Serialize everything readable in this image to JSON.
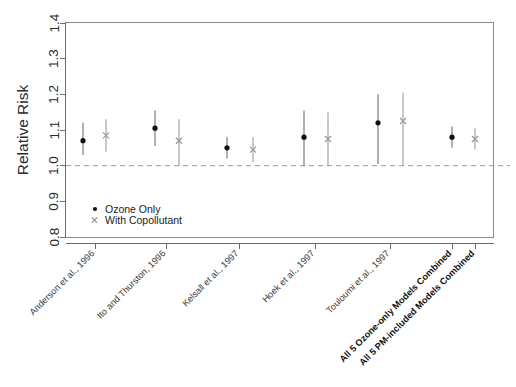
{
  "chart_data": {
    "type": "scatter",
    "title": "",
    "subtitle": "",
    "xlabel": "",
    "ylabel": "Relative Risk",
    "ylim": [
      0.8,
      1.4
    ],
    "yticks": [
      "0.8",
      "0.9",
      "1.0",
      "1.1",
      "1.2",
      "1.3",
      "1.4"
    ],
    "ytick_values": [
      0.8,
      0.9,
      1.0,
      1.1,
      1.2,
      1.3,
      1.4
    ],
    "grid": false,
    "reference_line": 1.0,
    "legend_position": "bottom-left",
    "categories": [
      "Anderson et al., 1996",
      "Ito and Thurston, 1996",
      "Kelsall et al., 1997",
      "Hoek et al., 1997",
      "Touloumi et al., 1997",
      "All 5 Ozone-only Models Combined",
      "All 5 PM-included Models Combined"
    ],
    "categories_bold": [
      false,
      false,
      false,
      false,
      false,
      true,
      true
    ],
    "series": [
      {
        "name": "Ozone Only",
        "marker": "dot",
        "points": [
          {
            "category": "Anderson et al., 1996",
            "value": 1.07,
            "low": 1.03,
            "high": 1.12
          },
          {
            "category": "Ito and Thurston, 1996",
            "value": 1.105,
            "low": 1.055,
            "high": 1.155
          },
          {
            "category": "Kelsall et al., 1997",
            "value": 1.05,
            "low": 1.02,
            "high": 1.08
          },
          {
            "category": "Hoek et al., 1997",
            "value": 1.08,
            "low": 1.0,
            "high": 1.155
          },
          {
            "category": "Touloumi et al., 1997",
            "value": 1.12,
            "low": 1.005,
            "high": 1.2
          },
          {
            "category": "All 5 Ozone-only Models Combined",
            "value": 1.08,
            "low": 1.05,
            "high": 1.11
          }
        ]
      },
      {
        "name": "With Copollutant",
        "marker": "cross",
        "points": [
          {
            "category": "Anderson et al., 1996",
            "value": 1.085,
            "low": 1.04,
            "high": 1.13
          },
          {
            "category": "Ito and Thurston, 1996",
            "value": 1.07,
            "low": 1.0,
            "high": 1.13
          },
          {
            "category": "Kelsall et al., 1997",
            "value": 1.045,
            "low": 1.01,
            "high": 1.08
          },
          {
            "category": "Hoek et al., 1997",
            "value": 1.075,
            "low": 1.0,
            "high": 1.15
          },
          {
            "category": "Touloumi et al., 1997",
            "value": 1.125,
            "low": 1.0,
            "high": 1.205
          },
          {
            "category": "All 5 PM-included Models Combined",
            "value": 1.075,
            "low": 1.045,
            "high": 1.105
          }
        ]
      }
    ],
    "legend": [
      {
        "label": "Ozone Only",
        "marker": "dot"
      },
      {
        "label": "With Copollutant",
        "marker": "cross"
      }
    ],
    "colors": {
      "point_dark": "#111111",
      "point_light": "#9b9b9b",
      "errorbar": "#9b9b9b",
      "reference_line": "#9a9a9a",
      "frame": "#8a8a8a",
      "text": "#2b2b2b",
      "background": "#ffffff"
    }
  }
}
